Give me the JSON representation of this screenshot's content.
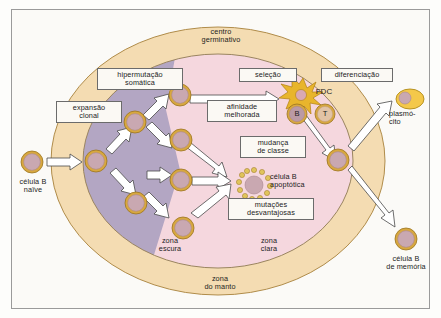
{
  "figure": {
    "title_region": "germinal center B cell reaction diagram",
    "language": "pt-BR"
  },
  "zones": [
    {
      "id": "mantle",
      "label_line1": "zona",
      "label_line2": "do manto",
      "color": "#f4dcb2"
    },
    {
      "id": "dark-zone",
      "label_line1": "zona",
      "label_line2": "escura",
      "color": "#b3a6c3"
    },
    {
      "id": "light-zone",
      "label_line1": "zona",
      "label_line2": "clara",
      "color": "#f5d7de"
    },
    {
      "id": "germinal-center",
      "label_line1": "centro",
      "label_line2": "germinativo",
      "color": "#f4dcb2"
    }
  ],
  "process_labels": [
    {
      "id": "expansao-clonal",
      "line1": "expansão",
      "line2": "clonal"
    },
    {
      "id": "hipermutacao-somatica",
      "line1": "hipermutação",
      "line2": "somática"
    },
    {
      "id": "selecao",
      "line1": "seleção",
      "line2": ""
    },
    {
      "id": "diferenciacao",
      "line1": "diferenciação",
      "line2": ""
    },
    {
      "id": "afinidade-melhorada",
      "line1": "afinidade",
      "line2": "melhorada"
    },
    {
      "id": "mudanca-de-classe",
      "line1": "mudança",
      "line2": "de classe"
    },
    {
      "id": "mutacoes-desvantajosas",
      "line1": "mutações",
      "line2": "desvantajosas"
    }
  ],
  "cell_labels": [
    {
      "id": "celula-b-naive",
      "line1": "célula B",
      "line2": "naïve"
    },
    {
      "id": "celula-b-apoptotica",
      "line1": "célula B",
      "line2": "apoptótica"
    },
    {
      "id": "plasmocito",
      "line1": "plasmó-",
      "line2": "cito"
    },
    {
      "id": "celula-b-memoria",
      "line1": "célula B",
      "line2": "de memória"
    }
  ],
  "marker_labels": [
    {
      "id": "fdc",
      "text": "FDC"
    },
    {
      "id": "b-cell-marker",
      "text": "B"
    },
    {
      "id": "t-cell-marker",
      "text": "T"
    }
  ],
  "colors": {
    "mantle_zone": "#f4dcb2",
    "dark_zone": "#b3a6c3",
    "light_zone": "#f5d7de",
    "cell_cytoplasm": "#c9a8b1",
    "cell_membrane": "#d8a83f",
    "plasma_cell": "#f4c84a",
    "fdc": "#e8b52c",
    "arrow_fill": "#ffffff",
    "arrow_stroke": "#4a4a4a",
    "text": "#1c1c1c",
    "frame": "#9a9a9a"
  }
}
